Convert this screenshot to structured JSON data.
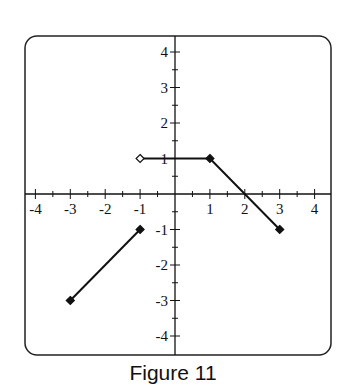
{
  "caption": "Figure 11",
  "chart_data": {
    "type": "line",
    "title": "Figure 11",
    "xlabel": "",
    "ylabel": "",
    "xlim": [
      -4.4,
      4.4
    ],
    "ylim": [
      -4.4,
      4.4
    ],
    "grid": false,
    "x_ticks": [
      -4,
      -3,
      -2,
      -1,
      1,
      2,
      3,
      4
    ],
    "y_ticks": [
      4,
      3,
      2,
      1,
      -1,
      -2,
      -3,
      -4
    ],
    "x_tick_labels": [
      "-4",
      "-3",
      "-2",
      "-1",
      "1",
      "2",
      "3",
      "4"
    ],
    "y_tick_labels": [
      "4",
      "3",
      "2",
      "1",
      "-1",
      "-2",
      "-3",
      "-4"
    ],
    "series": [
      {
        "name": "segment-1",
        "points": [
          {
            "x": -3,
            "y": -3
          },
          {
            "x": -1,
            "y": -1
          }
        ],
        "endpoints": [
          "closed",
          "closed"
        ]
      },
      {
        "name": "segment-2",
        "points": [
          {
            "x": -1,
            "y": 1
          },
          {
            "x": 1,
            "y": 1
          },
          {
            "x": 3,
            "y": -1
          }
        ],
        "endpoints": [
          "open",
          "closed",
          "closed"
        ]
      }
    ]
  },
  "colors": {
    "line": "#111111",
    "frame": "#222222",
    "open_marker_fill": "#ffffff"
  }
}
